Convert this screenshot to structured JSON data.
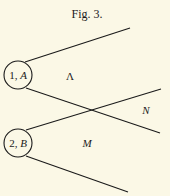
{
  "figure": {
    "title": "Fig. 3.",
    "nodes": [
      {
        "number": "1,",
        "letter": "A"
      },
      {
        "number": "2,",
        "letter": "B"
      }
    ],
    "region_labels": {
      "upper": "Λ",
      "right": "N",
      "lower": "M"
    }
  }
}
